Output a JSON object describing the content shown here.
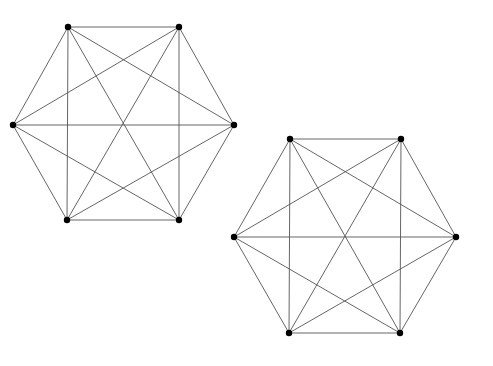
{
  "diagram": {
    "type": "graph",
    "background": "#ffffff",
    "edge_color": "#555555",
    "vertex_color": "#000000",
    "graphs": [
      {
        "name": "K6-left",
        "vertices": [
          [
            68,
            27
          ],
          [
            179,
            27
          ],
          [
            234,
            125
          ],
          [
            179,
            220
          ],
          [
            67,
            220
          ],
          [
            13,
            125
          ]
        ],
        "edges": [
          [
            0,
            1
          ],
          [
            0,
            2
          ],
          [
            0,
            3
          ],
          [
            0,
            4
          ],
          [
            0,
            5
          ],
          [
            1,
            2
          ],
          [
            1,
            3
          ],
          [
            1,
            4
          ],
          [
            1,
            5
          ],
          [
            2,
            3
          ],
          [
            2,
            4
          ],
          [
            2,
            5
          ],
          [
            3,
            4
          ],
          [
            3,
            5
          ],
          [
            4,
            5
          ]
        ]
      },
      {
        "name": "K6-right",
        "vertices": [
          [
            290,
            139
          ],
          [
            401,
            139
          ],
          [
            456,
            237
          ],
          [
            400,
            333
          ],
          [
            289,
            333
          ],
          [
            234,
            237
          ]
        ],
        "edges": [
          [
            0,
            1
          ],
          [
            0,
            2
          ],
          [
            0,
            3
          ],
          [
            0,
            4
          ],
          [
            0,
            5
          ],
          [
            1,
            2
          ],
          [
            1,
            3
          ],
          [
            1,
            4
          ],
          [
            1,
            5
          ],
          [
            2,
            3
          ],
          [
            2,
            4
          ],
          [
            2,
            5
          ],
          [
            3,
            4
          ],
          [
            3,
            5
          ],
          [
            4,
            5
          ]
        ]
      }
    ]
  }
}
